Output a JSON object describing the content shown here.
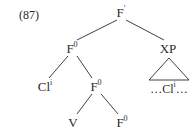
{
  "example": {
    "number_label": "(87)"
  },
  "diagram": {
    "type": "syntax-tree",
    "ink_color": "#2b2b2b",
    "background_color": "#ffffff",
    "nodes": [
      {
        "id": "root",
        "label": "F",
        "superscript": "′",
        "x": 121,
        "y": 12
      },
      {
        "id": "f0-upper",
        "label": "F",
        "superscript": "0",
        "x": 72,
        "y": 48
      },
      {
        "id": "xp",
        "label": "XP",
        "superscript": "",
        "x": 168,
        "y": 48
      },
      {
        "id": "cl-spec",
        "label": "Cl",
        "superscript": "i",
        "x": 45,
        "y": 86
      },
      {
        "id": "f0-mid",
        "label": "F",
        "superscript": "0",
        "x": 96,
        "y": 86
      },
      {
        "id": "v",
        "label": "V",
        "superscript": "",
        "x": 73,
        "y": 122
      },
      {
        "id": "f0-lower",
        "label": "F",
        "superscript": "0",
        "x": 122,
        "y": 122
      }
    ],
    "triangle_leaf": {
      "id": "xp-ellipsis",
      "prefix": "…",
      "label": "Cl",
      "superscript": "i",
      "suffix": "…",
      "x": 169,
      "y": 88
    },
    "edges": [
      {
        "from": "root",
        "to": "f0-upper"
      },
      {
        "from": "root",
        "to": "xp"
      },
      {
        "from": "f0-upper",
        "to": "cl-spec"
      },
      {
        "from": "f0-upper",
        "to": "f0-mid"
      },
      {
        "from": "f0-mid",
        "to": "v"
      },
      {
        "from": "f0-mid",
        "to": "f0-lower"
      }
    ],
    "triangle": {
      "apex_x": 169,
      "apex_y": 58,
      "left_x": 149,
      "left_y": 80,
      "right_x": 189,
      "right_y": 80
    }
  }
}
